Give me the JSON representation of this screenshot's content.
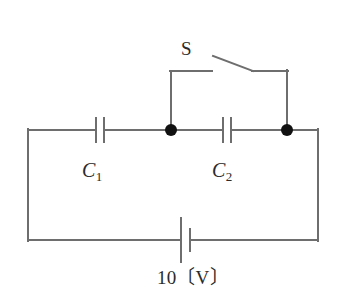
{
  "figure": {
    "kind": "circuit-diagram",
    "width": 339,
    "height": 305,
    "background_color": "#ffffff",
    "wire_color": "#6e6e6e",
    "node_color": "#111111",
    "text_color": "#2b2b2b"
  },
  "labels": {
    "switch": "S",
    "capacitor1": "C",
    "capacitor1_sub": "1",
    "capacitor2": "C",
    "capacitor2_sub": "2",
    "source": "10〔V〕"
  },
  "components": [
    {
      "name": "capacitor-c1",
      "type": "capacitor",
      "label": "C1",
      "x": 100,
      "y": 130,
      "orientation": "vertical-plates"
    },
    {
      "name": "capacitor-c2",
      "type": "capacitor",
      "label": "C2",
      "x": 227,
      "y": 130,
      "orientation": "vertical-plates"
    },
    {
      "name": "switch-s",
      "type": "switch",
      "label": "S",
      "state": "open",
      "x": 229,
      "y": 64
    },
    {
      "name": "battery",
      "type": "dc-source",
      "label": "10〔V〕",
      "voltage": 10,
      "unit": "V",
      "x": 186,
      "y": 240
    },
    {
      "name": "junction-node-left",
      "type": "node",
      "x": 171,
      "y": 130
    },
    {
      "name": "junction-node-right",
      "type": "node",
      "x": 287,
      "y": 130
    }
  ],
  "geometry": {
    "outer_loop": {
      "left_x": 28,
      "right_x": 318,
      "top_y": 130,
      "bottom_y": 240
    },
    "switch_branch": {
      "left_post_x": 171,
      "right_post_x": 287,
      "rail_y": 71,
      "blade_start": [
        213,
        56
      ],
      "blade_end": [
        253,
        71
      ]
    },
    "node_radius": 6
  }
}
